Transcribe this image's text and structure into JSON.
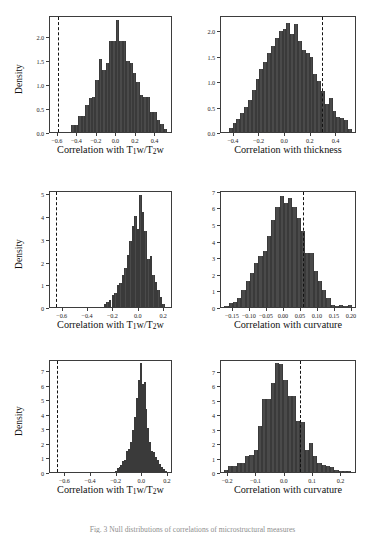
{
  "figure": {
    "caption": "Fig. 3  Null distributions of correlations of microstructural measures",
    "bar_color": "#4a4a4a",
    "axis_color": "#3d3d3d",
    "vline_color": "#121212"
  },
  "chart_data": [
    {
      "type": "bar",
      "panel": "top-left",
      "title": "",
      "xlabel": "Correlation with T1w/T2w",
      "ylabel": "Density",
      "xlim": [
        -0.68,
        0.58
      ],
      "ylim": [
        0,
        2.45
      ],
      "xticks": [
        -0.6,
        -0.4,
        -0.2,
        0.0,
        0.2,
        0.4
      ],
      "xticklabels": [
        "−0.6",
        "−0.4",
        "−0.2",
        "0.0",
        "0.2",
        "0.4"
      ],
      "yticks": [
        0.0,
        0.5,
        1.0,
        1.5,
        2.0
      ],
      "yticklabels": [
        "0.0",
        "0.5",
        "1.0",
        "1.5",
        "2.0"
      ],
      "grid": false,
      "vline": -0.6,
      "vline_style": "dashed",
      "bin_edges": [
        -0.46,
        -0.425,
        -0.39,
        -0.355,
        -0.32,
        -0.285,
        -0.25,
        -0.215,
        -0.18,
        -0.145,
        -0.11,
        -0.075,
        -0.04,
        -0.005,
        0.03,
        0.065,
        0.1,
        0.135,
        0.17,
        0.205,
        0.24,
        0.275,
        0.31,
        0.345,
        0.38,
        0.415,
        0.45,
        0.485,
        0.52
      ],
      "values": [
        0.14,
        0.14,
        0.33,
        0.33,
        0.56,
        0.72,
        0.73,
        1.08,
        1.53,
        1.29,
        1.45,
        1.9,
        1.9,
        2.35,
        1.91,
        1.9,
        1.48,
        1.45,
        1.24,
        1.05,
        0.78,
        0.74,
        0.73,
        0.42,
        0.41,
        0.25,
        0.16,
        0.06
      ]
    },
    {
      "type": "bar",
      "panel": "top-right",
      "title": "",
      "xlabel": "Correlation with thickness",
      "ylabel": "",
      "xlim": [
        -0.5,
        0.56
      ],
      "ylim": [
        0,
        2.3
      ],
      "xticks": [
        -0.4,
        -0.2,
        0.0,
        0.2,
        0.4
      ],
      "xticklabels": [
        "−0.4",
        "−0.2",
        "0.0",
        "0.2",
        "0.4"
      ],
      "yticks": [
        0.0,
        0.5,
        1.0,
        1.5,
        2.0
      ],
      "yticklabels": [
        "0.0",
        "0.5",
        "1.0",
        "1.5",
        "2.0"
      ],
      "grid": false,
      "vline": 0.285,
      "vline_style": "dashed",
      "bin_edges": [
        -0.44,
        -0.41,
        -0.38,
        -0.35,
        -0.32,
        -0.29,
        -0.26,
        -0.23,
        -0.2,
        -0.17,
        -0.14,
        -0.11,
        -0.08,
        -0.05,
        -0.02,
        0.01,
        0.04,
        0.07,
        0.1,
        0.13,
        0.16,
        0.19,
        0.22,
        0.25,
        0.28,
        0.31,
        0.34,
        0.37,
        0.4,
        0.43,
        0.46,
        0.49,
        0.52
      ],
      "values": [
        0.08,
        0.18,
        0.26,
        0.38,
        0.5,
        0.63,
        0.82,
        1.04,
        1.23,
        1.38,
        1.55,
        1.7,
        1.84,
        1.98,
        2.03,
        2.15,
        1.93,
        2.13,
        1.78,
        1.62,
        1.56,
        1.48,
        1.14,
        1.0,
        0.8,
        0.55,
        0.66,
        0.42,
        0.3,
        0.28,
        0.23,
        0.06
      ]
    },
    {
      "type": "bar",
      "panel": "middle-left",
      "title": "",
      "xlabel": "Correlation with T1w/T2w",
      "ylabel": "Density",
      "xlim": [
        -0.7,
        0.27
      ],
      "ylim": [
        0,
        5.15
      ],
      "xticks": [
        -0.6,
        -0.4,
        -0.2,
        0.0,
        0.2
      ],
      "xticklabels": [
        "−0.6",
        "−0.4",
        "−0.2",
        "0.0",
        "0.2"
      ],
      "yticks": [
        0,
        1,
        2,
        3,
        4,
        5
      ],
      "yticklabels": [
        "0",
        "1",
        "2",
        "3",
        "4",
        "5"
      ],
      "grid": false,
      "vline": -0.655,
      "vline_style": "dashed",
      "bin_edges": [
        -0.275,
        -0.255,
        -0.235,
        -0.215,
        -0.195,
        -0.175,
        -0.155,
        -0.135,
        -0.115,
        -0.095,
        -0.075,
        -0.055,
        -0.035,
        -0.015,
        0.005,
        0.025,
        0.045,
        0.065,
        0.085,
        0.105,
        0.125,
        0.145,
        0.165,
        0.185,
        0.205
      ],
      "values": [
        0.15,
        0.22,
        0.3,
        0.55,
        0.6,
        0.95,
        1.05,
        1.4,
        1.7,
        2.3,
        2.9,
        3.55,
        4.0,
        3.45,
        4.95,
        4.2,
        3.35,
        2.1,
        2.25,
        1.4,
        1.1,
        0.75,
        0.45,
        0.12
      ]
    },
    {
      "type": "bar",
      "panel": "middle-right",
      "title": "",
      "xlabel": "Correlation with curvature",
      "ylabel": "",
      "xlim": [
        -0.185,
        0.215
      ],
      "ylim": [
        0,
        7.05
      ],
      "xticks": [
        -0.15,
        -0.1,
        -0.05,
        0.0,
        0.05,
        0.1,
        0.15,
        0.2
      ],
      "xticklabels": [
        "−0.15",
        "−0.10",
        "−0.05",
        "0.00",
        "0.05",
        "0.10",
        "0.15",
        "0.20"
      ],
      "yticks": [
        0,
        1,
        2,
        3,
        4,
        5,
        6,
        7
      ],
      "yticklabels": [
        "0",
        "1",
        "2",
        "3",
        "4",
        "5",
        "6",
        "7"
      ],
      "grid": false,
      "vline": 0.055,
      "vline_style": "dashed",
      "bin_edges": [
        -0.175,
        -0.1625,
        -0.15,
        -0.1375,
        -0.125,
        -0.1125,
        -0.1,
        -0.0875,
        -0.075,
        -0.0625,
        -0.05,
        -0.0375,
        -0.025,
        -0.0125,
        0.0,
        0.0125,
        0.025,
        0.0375,
        0.05,
        0.0625,
        0.075,
        0.0875,
        0.1,
        0.1125,
        0.125,
        0.1375,
        0.15,
        0.1625,
        0.175,
        0.1875,
        0.2
      ],
      "values": [
        0.08,
        0.25,
        0.3,
        0.55,
        1.0,
        1.55,
        2.05,
        2.65,
        3.05,
        3.35,
        4.25,
        5.25,
        6.05,
        6.7,
        6.25,
        6.55,
        6.05,
        5.35,
        4.6,
        3.25,
        3.25,
        2.15,
        1.55,
        1.05,
        0.55,
        0.1,
        0.06,
        0.14,
        0.05,
        0.1
      ]
    },
    {
      "type": "bar",
      "panel": "bottom-left",
      "title": "",
      "xlabel": "Correlation with T1w/T2w",
      "ylabel": "Density",
      "xlim": [
        -0.72,
        0.24
      ],
      "ylim": [
        0,
        7.75
      ],
      "xticks": [
        -0.6,
        -0.4,
        -0.2,
        0.0,
        0.2
      ],
      "xticklabels": [
        "−0.6",
        "−0.4",
        "−0.2",
        "0.0",
        "0.2"
      ],
      "yticks": [
        0,
        1,
        2,
        3,
        4,
        5,
        6,
        7
      ],
      "yticklabels": [
        "0",
        "1",
        "2",
        "3",
        "4",
        "5",
        "6",
        "7"
      ],
      "grid": false,
      "vline": -0.665,
      "vline_style": "dashed",
      "bin_edges": [
        -0.215,
        -0.2,
        -0.185,
        -0.17,
        -0.155,
        -0.14,
        -0.125,
        -0.11,
        -0.095,
        -0.08,
        -0.065,
        -0.05,
        -0.035,
        -0.02,
        -0.005,
        0.01,
        0.025,
        0.04,
        0.055,
        0.07,
        0.085,
        0.1,
        0.115,
        0.13,
        0.145,
        0.16,
        0.175,
        0.19
      ],
      "values": [
        0.1,
        0.25,
        0.35,
        0.45,
        0.75,
        0.85,
        1.45,
        1.55,
        2.05,
        2.85,
        3.75,
        5.05,
        6.3,
        7.45,
        6.05,
        6.2,
        4.3,
        3.05,
        2.05,
        1.45,
        1.35,
        1.05,
        0.85,
        0.55,
        0.35,
        0.2,
        0.08
      ]
    },
    {
      "type": "bar",
      "panel": "bottom-right",
      "title": "",
      "xlabel": "Correlation with curvature",
      "ylabel": "",
      "xlim": [
        -0.225,
        0.255
      ],
      "ylim": [
        0,
        7.8
      ],
      "xticks": [
        -0.2,
        -0.1,
        0.0,
        0.1,
        0.2
      ],
      "xticklabels": [
        "−0.2",
        "−0.1",
        "0.0",
        "0.1",
        "0.2"
      ],
      "yticks": [
        0,
        1,
        2,
        3,
        4,
        5,
        6,
        7
      ],
      "yticklabels": [
        "0",
        "1",
        "2",
        "3",
        "4",
        "5",
        "6",
        "7"
      ],
      "grid": false,
      "vline": 0.055,
      "vline_style": "dashed",
      "bin_edges": [
        -0.215,
        -0.2,
        -0.185,
        -0.17,
        -0.155,
        -0.14,
        -0.125,
        -0.11,
        -0.095,
        -0.08,
        -0.065,
        -0.05,
        -0.035,
        -0.02,
        -0.005,
        0.01,
        0.025,
        0.04,
        0.055,
        0.07,
        0.085,
        0.1,
        0.115,
        0.13,
        0.145,
        0.16,
        0.175,
        0.19,
        0.205,
        0.22,
        0.235
      ],
      "values": [
        0.15,
        0.4,
        0.4,
        0.6,
        0.62,
        1.1,
        1.15,
        1.55,
        3.15,
        5.05,
        5.05,
        6.15,
        7.55,
        7.45,
        6.35,
        5.25,
        5.25,
        3.5,
        3.45,
        1.5,
        2.0,
        1.1,
        0.65,
        0.45,
        0.4,
        0.35,
        0.12,
        0.1,
        0.1,
        0.07
      ]
    }
  ]
}
